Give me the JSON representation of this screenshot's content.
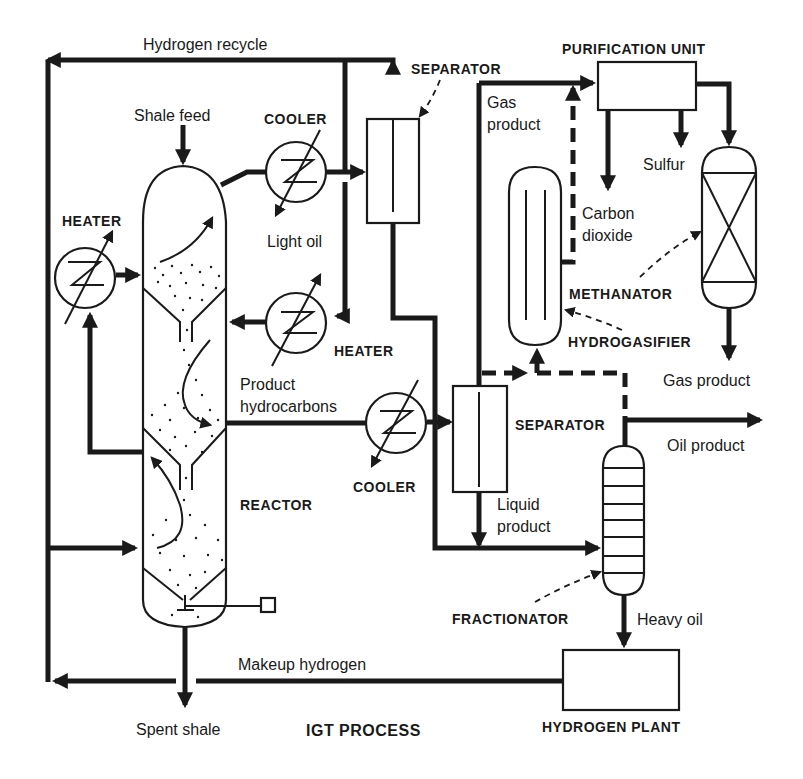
{
  "title": "IGT PROCESS",
  "colors": {
    "ink": "#1a1a1a",
    "background": "#ffffff"
  },
  "streams": {
    "hydrogen_recycle": "Hydrogen recycle",
    "shale_feed": "Shale feed",
    "light_oil": "Light oil",
    "product_hydrocarbons_line1": "Product",
    "product_hydrocarbons_line2": "hydrocarbons",
    "gas_product_top_line1": "Gas",
    "gas_product_top_line2": "product",
    "carbon_dioxide_line1": "Carbon",
    "carbon_dioxide_line2": "dioxide",
    "sulfur": "Sulfur",
    "gas_product_out": "Gas product",
    "oil_product": "Oil product",
    "liquid_product_line1": "Liquid",
    "liquid_product_line2": "product",
    "heavy_oil": "Heavy oil",
    "makeup_hydrogen": "Makeup hydrogen",
    "spent_shale": "Spent shale"
  },
  "equipment": {
    "separator_top": "SEPARATOR",
    "purification_unit": "PURIFICATION UNIT",
    "cooler_top": "COOLER",
    "heater_left": "HEATER",
    "heater_mid": "HEATER",
    "methanator": "METHANATOR",
    "hydrogasifier": "HYDROGASIFIER",
    "separator_mid": "SEPARATOR",
    "cooler_mid": "COOLER",
    "reactor": "REACTOR",
    "fractionator": "FRACTIONATOR",
    "hydrogen_plant": "HYDROGEN PLANT"
  }
}
